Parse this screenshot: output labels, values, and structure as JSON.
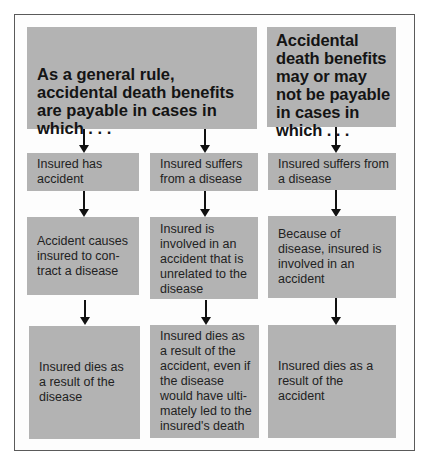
{
  "diagram": {
    "headers": [
      {
        "id": "general-rule",
        "text": "As a general rule, accidental death benefits are payable in cases in which . . ."
      },
      {
        "id": "may-or-may-not",
        "text": "Accidental death benefits may or may not be payable in cases in which . . ."
      }
    ],
    "columns": [
      {
        "steps": [
          "Insured has accident",
          "Accident causes insured to con-tract a disease",
          "Insured dies as a result of the disease"
        ]
      },
      {
        "steps": [
          "Insured suffers from a disease",
          "Insured is involved in an accident that is unrelated to the disease",
          "Insured dies as a result of the accident, even if the disease would have ulti-mately led to the insured's death"
        ]
      },
      {
        "steps": [
          "Insured suffers from a disease",
          "Because of disease, insured is involved in an accident",
          "Insured dies as a result of the accident"
        ]
      }
    ],
    "colors": {
      "box": "#b3b3b3",
      "frame": "#5a5a5a",
      "arrow": "#111111",
      "background": "#ffffff"
    }
  }
}
